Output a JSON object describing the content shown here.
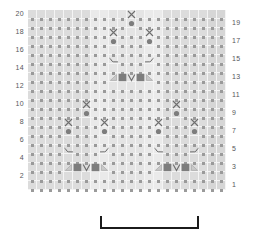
{
  "diagram": {
    "kind": "knitting-stitch-chart",
    "grid": {
      "columns": 22,
      "rows": 20,
      "cell_px": 9,
      "background_color": "#e2e2e2",
      "gridline_color": "#f4f4f4",
      "knit_dot_color": "#9a9a9a",
      "symbol_dark_color": "#7d7d7d",
      "symbol_line_color": "#6e6e6e"
    },
    "row_numbers": {
      "left_label": "even rows",
      "right_label": "odd rows",
      "left": [
        "20",
        "18",
        "16",
        "14",
        "12",
        "10",
        "8",
        "6",
        "4",
        "2"
      ],
      "right": [
        "19",
        "17",
        "15",
        "13",
        "11",
        "9",
        "7",
        "5",
        "3",
        "1"
      ]
    },
    "shaded_column_bands": [
      {
        "start_col": 1,
        "end_col": 7,
        "color": "#dcdcdc"
      },
      {
        "start_col": 8,
        "end_col": 9,
        "color": "#eaeaea"
      },
      {
        "start_col": 10,
        "end_col": 13,
        "color": "#e4e4e4"
      },
      {
        "start_col": 14,
        "end_col": 15,
        "color": "#eaeaea"
      },
      {
        "start_col": 16,
        "end_col": 20,
        "color": "#dcdcdc"
      },
      {
        "start_col": 21,
        "end_col": 22,
        "color": "#d6d6d6"
      }
    ],
    "legend_symbols": [
      {
        "key": "knit",
        "name": "knit-stitch-dot",
        "glyph": "small square dot"
      },
      {
        "key": "cross",
        "name": "cable-cross-x",
        "glyph": "X"
      },
      {
        "key": "bobble",
        "name": "bobble-filled-circle",
        "glyph": "filled circle"
      },
      {
        "key": "curve_left",
        "name": "decrease-curve-left",
        "glyph": "left sloping curve"
      },
      {
        "key": "curve_right",
        "name": "decrease-curve-right",
        "glyph": "right sloping curve"
      },
      {
        "key": "tri_left",
        "name": "ssk-left-triangle",
        "glyph": "left triangle"
      },
      {
        "key": "tri_right",
        "name": "k2tog-right-triangle",
        "glyph": "right triangle"
      },
      {
        "key": "block",
        "name": "purl-filled-block",
        "glyph": "filled square"
      },
      {
        "key": "vee",
        "name": "center-double-decrease-v",
        "glyph": "V"
      }
    ],
    "symbols": [
      {
        "row": 20,
        "col": 12,
        "key": "cross"
      },
      {
        "row": 19,
        "col": 12,
        "key": "bobble"
      },
      {
        "row": 18,
        "col": 10,
        "key": "cross"
      },
      {
        "row": 18,
        "col": 14,
        "key": "cross"
      },
      {
        "row": 17,
        "col": 10,
        "key": "bobble"
      },
      {
        "row": 17,
        "col": 14,
        "key": "bobble"
      },
      {
        "row": 15,
        "col": 10,
        "key": "curve_left"
      },
      {
        "row": 15,
        "col": 14,
        "key": "curve_right"
      },
      {
        "row": 13,
        "col": 10,
        "key": "tri_left"
      },
      {
        "row": 13,
        "col": 11,
        "key": "block"
      },
      {
        "row": 13,
        "col": 12,
        "key": "vee"
      },
      {
        "row": 13,
        "col": 13,
        "key": "block"
      },
      {
        "row": 13,
        "col": 14,
        "key": "tri_right"
      },
      {
        "row": 10,
        "col": 7,
        "key": "cross"
      },
      {
        "row": 10,
        "col": 17,
        "key": "cross"
      },
      {
        "row": 9,
        "col": 7,
        "key": "bobble"
      },
      {
        "row": 9,
        "col": 17,
        "key": "bobble"
      },
      {
        "row": 8,
        "col": 5,
        "key": "cross"
      },
      {
        "row": 8,
        "col": 9,
        "key": "cross"
      },
      {
        "row": 8,
        "col": 15,
        "key": "cross"
      },
      {
        "row": 8,
        "col": 19,
        "key": "cross"
      },
      {
        "row": 7,
        "col": 5,
        "key": "bobble"
      },
      {
        "row": 7,
        "col": 9,
        "key": "bobble"
      },
      {
        "row": 7,
        "col": 15,
        "key": "bobble"
      },
      {
        "row": 7,
        "col": 19,
        "key": "bobble"
      },
      {
        "row": 5,
        "col": 5,
        "key": "curve_left"
      },
      {
        "row": 5,
        "col": 9,
        "key": "curve_right"
      },
      {
        "row": 5,
        "col": 15,
        "key": "curve_left"
      },
      {
        "row": 5,
        "col": 19,
        "key": "curve_right"
      },
      {
        "row": 3,
        "col": 5,
        "key": "tri_left"
      },
      {
        "row": 3,
        "col": 6,
        "key": "block"
      },
      {
        "row": 3,
        "col": 7,
        "key": "vee"
      },
      {
        "row": 3,
        "col": 8,
        "key": "block"
      },
      {
        "row": 3,
        "col": 9,
        "key": "tri_right"
      },
      {
        "row": 3,
        "col": 15,
        "key": "tri_left"
      },
      {
        "row": 3,
        "col": 16,
        "key": "block"
      },
      {
        "row": 3,
        "col": 17,
        "key": "vee"
      },
      {
        "row": 3,
        "col": 18,
        "key": "block"
      },
      {
        "row": 3,
        "col": 19,
        "key": "tri_right"
      }
    ],
    "repeat_bracket": {
      "label": "",
      "start_col": 9,
      "end_col": 19,
      "color": "#1b1b1b"
    }
  }
}
